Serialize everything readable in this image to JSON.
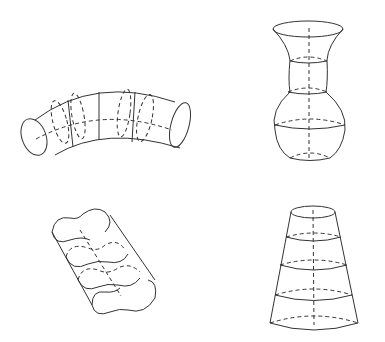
{
  "figure": {
    "panels": [
      {
        "id": "bent-tube",
        "label": "",
        "description": "Curved cylindrical tube with cross-section rings"
      },
      {
        "id": "vase",
        "label": "",
        "description": "Vase-shaped solid of revolution with dashed axis"
      },
      {
        "id": "figure-eight-prism",
        "label": "",
        "description": "Oblique prism with figure-eight cross sections"
      },
      {
        "id": "frustum",
        "label": "",
        "description": "Truncated cone with horizontal ellipse sections and dashed axis"
      }
    ],
    "colors": {
      "stroke": "#333333",
      "background": "#ffffff"
    }
  }
}
